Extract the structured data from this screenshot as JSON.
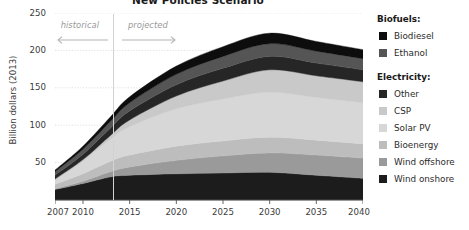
{
  "title": "New Policies Scenario",
  "axes": {
    "ylabel": "Billion dollars (2013)",
    "yticks": [
      "250",
      "200",
      "150",
      "100",
      "50"
    ],
    "xticks": [
      "2007",
      "2010",
      "2015",
      "2020",
      "2025",
      "2030",
      "2035",
      "2040"
    ]
  },
  "annotations": {
    "historical": "historical",
    "projected": "projected"
  },
  "legend": {
    "group1_title": "Biofuels:",
    "group2_title": "Electricity:",
    "items": [
      {
        "label": "Biodiesel",
        "color": "#0d0d0d"
      },
      {
        "label": "Ethanol",
        "color": "#555555"
      },
      {
        "label": "Other",
        "color": "#262626"
      },
      {
        "label": "CSP",
        "color": "#c9c9c9"
      },
      {
        "label": "Solar PV",
        "color": "#d7d7d7"
      },
      {
        "label": "Bioenergy",
        "color": "#bdbdbd"
      },
      {
        "label": "Wind offshore",
        "color": "#9a9a9a"
      },
      {
        "label": "Wind onshore",
        "color": "#1c1c1c"
      }
    ]
  },
  "chart_data": {
    "type": "area",
    "stacked": true,
    "title": "New Policies Scenario",
    "xlabel": "",
    "ylabel": "Billion dollars (2013)",
    "xlim": [
      2007,
      2040
    ],
    "ylim": [
      0,
      250
    ],
    "grid": true,
    "legend_position": "right",
    "x": [
      2007,
      2010,
      2013,
      2015,
      2020,
      2025,
      2030,
      2035,
      2040
    ],
    "series": [
      {
        "name": "Wind onshore",
        "color": "#1c1c1c",
        "values": [
          14,
          22,
          31,
          33,
          35,
          36,
          37,
          33,
          29
        ]
      },
      {
        "name": "Wind offshore",
        "color": "#9a9a9a",
        "values": [
          1,
          3,
          7,
          11,
          18,
          23,
          26,
          27,
          27
        ]
      },
      {
        "name": "Bioenergy",
        "color": "#bdbdbd",
        "values": [
          6,
          10,
          14,
          16,
          19,
          20,
          21,
          20,
          19
        ]
      },
      {
        "name": "Solar PV",
        "color": "#d7d7d7",
        "values": [
          6,
          17,
          30,
          38,
          50,
          56,
          60,
          57,
          55
        ]
      },
      {
        "name": "CSP",
        "color": "#c9c9c9",
        "values": [
          1,
          2,
          5,
          9,
          17,
          24,
          30,
          29,
          28
        ]
      },
      {
        "name": "Other",
        "color": "#262626",
        "values": [
          5,
          7,
          10,
          12,
          15,
          17,
          18,
          17,
          16
        ]
      },
      {
        "name": "Ethanol",
        "color": "#555555",
        "values": [
          5,
          7,
          9,
          11,
          14,
          16,
          17,
          16,
          15
        ]
      },
      {
        "name": "Biodiesel",
        "color": "#0d0d0d",
        "values": [
          2,
          4,
          6,
          8,
          11,
          13,
          14,
          13,
          12
        ]
      }
    ],
    "totals": [
      40,
      72,
      112,
      138,
      179,
      205,
      223,
      212,
      201
    ]
  }
}
